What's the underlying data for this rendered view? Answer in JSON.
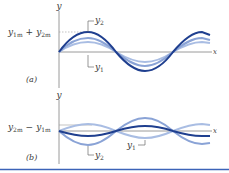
{
  "figure": {
    "panel_a": {
      "label": "(a)",
      "y_axis_label": "y",
      "x_axis_label": "x",
      "amplitude_label": {
        "y1": "y",
        "sub1": "1m",
        "plus": "+",
        "y2": "y",
        "sub2": "2m"
      },
      "curve_labels": {
        "y2": {
          "base": "y",
          "sub": "2"
        },
        "y1": {
          "base": "y",
          "sub": "1"
        }
      }
    },
    "panel_b": {
      "label": "(b)",
      "y_axis_label": "y",
      "x_axis_label": "x",
      "amplitude_label": {
        "y2": "y",
        "sub2": "2m",
        "minus": "−",
        "y1": "y",
        "sub1": "1m"
      },
      "curve_labels": {
        "y2": {
          "base": "y",
          "sub": "2"
        },
        "y1": {
          "base": "y",
          "sub": "1"
        }
      }
    },
    "colors": {
      "resultant": "#1f3f8f",
      "component_light": "#8aa3d6",
      "component_lighter": "#a9bde3",
      "axis": "#9a9a9a",
      "rule": "#3c63b8"
    }
  }
}
